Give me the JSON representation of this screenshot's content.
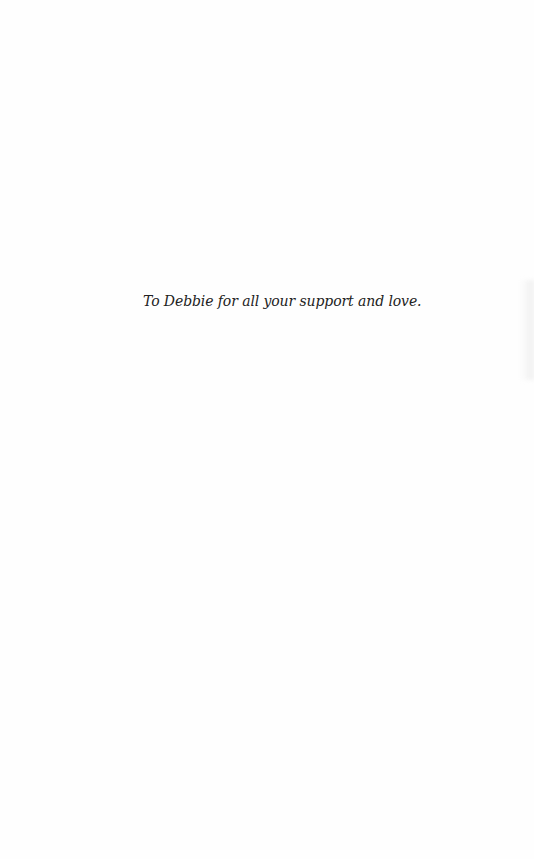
{
  "page": {
    "dedication": "To Debbie for all your support and love."
  }
}
